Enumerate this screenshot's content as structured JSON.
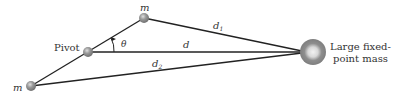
{
  "diagram": {
    "labels": {
      "mass_top": "m",
      "mass_bottom": "m",
      "pivot": "Pivot",
      "angle": "θ",
      "d": "d",
      "d1": "d",
      "d1_sub": "1",
      "d2": "d",
      "d2_sub": "2",
      "large_mass_line1": "Large fixed-",
      "large_mass_line2": "point mass"
    },
    "colors": {
      "line": "#222222",
      "ball": "#8a8a8a",
      "large_mass": "#888888"
    }
  }
}
